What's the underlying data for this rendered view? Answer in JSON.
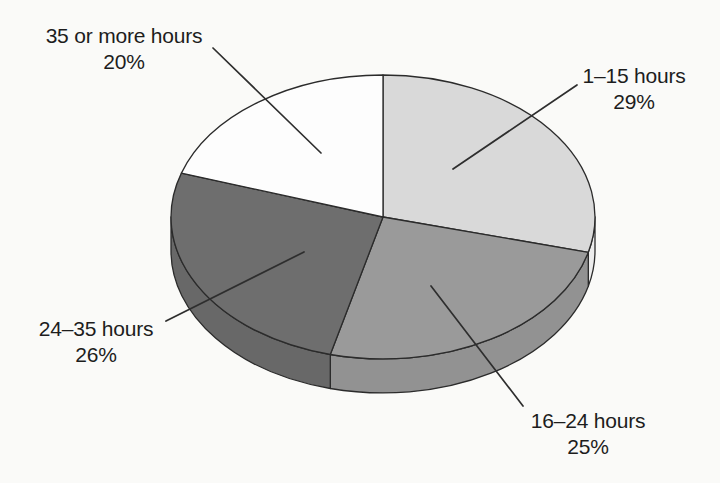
{
  "page": {
    "background_color": "#fafaf8"
  },
  "chart_data": {
    "type": "pie",
    "style": "3d-ellipse",
    "title": "",
    "direction": "clockwise",
    "start_angle_deg": 0,
    "legend_position": "none",
    "unit": "%",
    "categories": [
      "1–15 hours",
      "16–24 hours",
      "24–35 hours",
      "35 or more hours"
    ],
    "values": [
      29,
      25,
      26,
      20
    ],
    "slices": [
      {
        "label": "1–15 hours",
        "value": 29,
        "pct_text": "29%",
        "color": "#d9d9d9",
        "side_color": "#ececec"
      },
      {
        "label": "16–24 hours",
        "value": 25,
        "pct_text": "25%",
        "color": "#9a9a9a",
        "side_color": "#929292"
      },
      {
        "label": "24–35 hours",
        "value": 26,
        "pct_text": "26%",
        "color": "#6e6e6e",
        "side_color": "#686868"
      },
      {
        "label": "35 or more hours",
        "value": 20,
        "pct_text": "20%",
        "color": "#fdfdfd",
        "side_color": "#fdfdfd"
      }
    ],
    "outline_color": "#2b2b2b",
    "leader_line_color": "#2e2e2e",
    "label_text_color": "#1d1d1d"
  }
}
